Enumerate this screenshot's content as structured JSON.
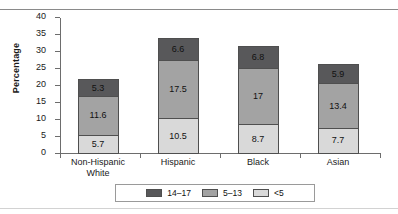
{
  "chart_data": {
    "type": "bar",
    "subtype": "stacked-column",
    "title": "",
    "xlabel": "",
    "ylabel": "Percentage",
    "ylim": [
      0,
      40
    ],
    "yticks": [
      0,
      5,
      10,
      15,
      20,
      25,
      30,
      35,
      40
    ],
    "grid": false,
    "legend_position": "bottom",
    "categories": [
      "Non-Hispanic White",
      "Hispanic",
      "Black",
      "Asian"
    ],
    "series": [
      {
        "name": "<5",
        "values": [
          5.7,
          10.5,
          8.7,
          7.7
        ],
        "color": "#d9d9d9"
      },
      {
        "name": "5–13",
        "values": [
          11.6,
          17.5,
          17,
          13.4
        ],
        "color": "#a3a3a3"
      },
      {
        "name": "14–17",
        "values": [
          5.3,
          6.6,
          6.8,
          5.9
        ],
        "color": "#58585a"
      }
    ],
    "totals": [
      22.6,
      34.6,
      32.5,
      27.0
    ],
    "legend": [
      {
        "label": "14–17",
        "color": "#58585a"
      },
      {
        "label": "5–13",
        "color": "#a3a3a3"
      },
      {
        "label": "<5",
        "color": "#d9d9d9"
      }
    ]
  },
  "axis": {
    "y_label": "Percentage",
    "y_ticks": [
      "40",
      "35",
      "30",
      "25",
      "20",
      "15",
      "10",
      "5",
      "0"
    ]
  },
  "categories": [
    {
      "line1": "Non-Hispanic",
      "line2": "White"
    },
    {
      "line1": "Hispanic",
      "line2": ""
    },
    {
      "line1": "Black",
      "line2": ""
    },
    {
      "line1": "Asian",
      "line2": ""
    }
  ],
  "bars": [
    {
      "name": "non-hispanic-white",
      "low": "5.7",
      "mid": "11.6",
      "high": "5.3"
    },
    {
      "name": "hispanic",
      "low": "10.5",
      "mid": "17.5",
      "high": "6.6"
    },
    {
      "name": "black",
      "low": "8.7",
      "mid": "17",
      "high": "6.8"
    },
    {
      "name": "asian",
      "low": "7.7",
      "mid": "13.4",
      "high": "5.9"
    }
  ],
  "legend": {
    "items": [
      {
        "label": "14–17"
      },
      {
        "label": "5–13"
      },
      {
        "label": "<5"
      }
    ]
  },
  "title_fragment": ""
}
